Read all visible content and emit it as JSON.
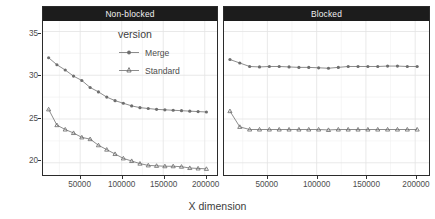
{
  "chart_data": {
    "type": "line",
    "title": "",
    "xlabel": "X dimension",
    "ylabel": "Performance GFLOPS",
    "xlim": [
      10000,
      210000
    ],
    "ylim": [
      18.6,
      36.2
    ],
    "xticks": [
      50000,
      100000,
      150000,
      200000
    ],
    "xtick_labels": [
      "50000",
      "100000",
      "150000",
      "200000"
    ],
    "yticks": [
      20,
      25,
      30,
      35
    ],
    "ytick_labels": [
      "20",
      "25",
      "30",
      "35"
    ],
    "grid": true,
    "legend": {
      "title": "version",
      "position": "inside-top-left-panel",
      "entries": [
        {
          "name": "Merge",
          "marker": "circle",
          "color": "#6b6b6b"
        },
        {
          "name": "Standard",
          "marker": "triangle",
          "color": "#6b6b6b"
        }
      ]
    },
    "facets": [
      {
        "label": "Non-blocked",
        "series": [
          {
            "name": "Merge",
            "marker": "circle",
            "x": [
              12000,
              22000,
              32000,
              42000,
              52000,
              62000,
              72000,
              82000,
              92000,
              102000,
              112000,
              122000,
              132000,
              142000,
              152000,
              162000,
              172000,
              182000,
              192000,
              202000
            ],
            "y": [
              32.0,
              31.2,
              30.6,
              29.9,
              29.4,
              28.6,
              28.1,
              27.5,
              27.1,
              26.8,
              26.5,
              26.3,
              26.2,
              26.1,
              26.05,
              26.0,
              25.95,
              25.9,
              25.85,
              25.8
            ]
          },
          {
            "name": "Standard",
            "marker": "triangle",
            "x": [
              12000,
              22000,
              32000,
              42000,
              52000,
              62000,
              72000,
              82000,
              92000,
              102000,
              112000,
              122000,
              132000,
              142000,
              152000,
              162000,
              172000,
              182000,
              192000,
              202000
            ],
            "y": [
              26.1,
              24.3,
              23.8,
              23.4,
              22.9,
              22.7,
              22.0,
              21.5,
              21.0,
              20.5,
              20.2,
              19.9,
              19.7,
              19.65,
              19.6,
              19.6,
              19.55,
              19.4,
              19.35,
              19.3
            ]
          }
        ]
      },
      {
        "label": "Blocked",
        "series": [
          {
            "name": "Merge",
            "marker": "circle",
            "x": [
              12000,
              22000,
              32000,
              42000,
              52000,
              62000,
              72000,
              82000,
              92000,
              102000,
              112000,
              122000,
              132000,
              142000,
              152000,
              162000,
              172000,
              182000,
              192000,
              202000
            ],
            "y": [
              31.8,
              31.4,
              31.0,
              30.95,
              31.0,
              31.0,
              30.95,
              30.9,
              30.9,
              30.85,
              30.8,
              30.9,
              31.0,
              31.0,
              31.0,
              31.0,
              31.05,
              31.05,
              31.0,
              31.0
            ]
          },
          {
            "name": "Standard",
            "marker": "triangle",
            "x": [
              12000,
              22000,
              32000,
              42000,
              52000,
              62000,
              72000,
              82000,
              92000,
              102000,
              112000,
              122000,
              132000,
              142000,
              152000,
              162000,
              172000,
              182000,
              192000,
              202000
            ],
            "y": [
              25.9,
              24.1,
              23.8,
              23.8,
              23.8,
              23.8,
              23.8,
              23.8,
              23.8,
              23.8,
              23.75,
              23.8,
              23.8,
              23.8,
              23.8,
              23.8,
              23.8,
              23.8,
              23.8,
              23.8
            ]
          }
        ]
      }
    ],
    "colors": {
      "line": "#6e6e6e",
      "grid_major": "#e3e3e3",
      "grid_minor": "#f0f0f0",
      "panel_border": "#2b2b2b",
      "strip_bg": "#1c1c1c",
      "strip_text": "#f2f2f2",
      "text": "#4d4d4d"
    }
  }
}
